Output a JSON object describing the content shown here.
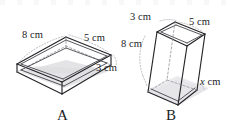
{
  "figure": {
    "background_color": "#ffffff",
    "edge_color": "#242428",
    "hidden_edge_color": "#8e8e96",
    "shading_color": "#d9d9dd",
    "units": "cm",
    "shapes": [
      {
        "caption": "A",
        "orientation": "lying flat, long side horizontal, open top",
        "labels": [
          {
            "name": "length",
            "text": "8 cm",
            "value": 8,
            "unit": "cm"
          },
          {
            "name": "width",
            "text": "5 cm",
            "value": 5,
            "unit": "cm"
          },
          {
            "name": "height",
            "text": "3 cm",
            "value": 3,
            "unit": "cm"
          }
        ]
      },
      {
        "caption": "B",
        "orientation": "standing upright, tall, open top",
        "labels": [
          {
            "name": "width",
            "text": "3 cm",
            "value": 3,
            "unit": "cm"
          },
          {
            "name": "depth",
            "text": "5 cm",
            "value": 5,
            "unit": "cm"
          },
          {
            "name": "height",
            "text": "8 cm",
            "value": 8,
            "unit": "cm"
          },
          {
            "name": "unknown",
            "text": "x cm",
            "value": "x",
            "unit": "cm"
          }
        ]
      }
    ]
  },
  "shape_a": {
    "label_8cm": "8 cm",
    "label_5cm": "5 cm",
    "label_3cm": "3 cm",
    "caption": "A"
  },
  "shape_b": {
    "label_3cm": "3 cm",
    "label_5cm": "5 cm",
    "label_8cm": "8 cm",
    "label_x_prefix": "x",
    "label_x_suffix": " cm",
    "caption": "B"
  }
}
